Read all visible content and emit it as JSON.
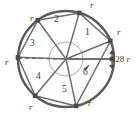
{
  "figure": {
    "type": "geometry-diagram",
    "colors": {
      "stroke": "#5a5a5a",
      "chord": "#6b6b6b",
      "vertex": "#4a4a4a",
      "inner_arc": "#9a9a9a",
      "dashed": "#6b6b6b",
      "text": "#3a3a3a",
      "background": "#ffffff"
    },
    "circle": {
      "center_x": 66,
      "center_y": 59,
      "radius": 48,
      "stroke_width": 2.2
    },
    "inner_arc": {
      "radius": 17,
      "label": "angle-arc"
    },
    "vertices": [
      {
        "id": "v1",
        "angle_deg": 22,
        "x": 110.5,
        "y": 41.0
      },
      {
        "id": "v2",
        "angle_deg": 74,
        "x": 79.2,
        "y": 12.9
      },
      {
        "id": "v3",
        "angle_deg": 126,
        "x": 37.8,
        "y": 20.2
      },
      {
        "id": "v4",
        "angle_deg": 178,
        "x": 18.0,
        "y": 57.3
      },
      {
        "id": "v5",
        "angle_deg": 230,
        "x": 35.1,
        "y": 95.8
      },
      {
        "id": "v6",
        "angle_deg": 282,
        "x": 76.0,
        "y": 105.9
      }
    ],
    "chord_labels": [
      {
        "text": "r",
        "x": 119,
        "y": 33
      },
      {
        "text": "r",
        "x": 92,
        "y": 5
      },
      {
        "text": "r",
        "x": 34,
        "y": 18
      },
      {
        "text": "r",
        "x": 10,
        "y": 61
      },
      {
        "text": "r",
        "x": 32,
        "y": 104
      },
      {
        "text": "r",
        "x": 88,
        "y": 102
      }
    ],
    "angle_labels": [
      {
        "text": "1",
        "x": 88,
        "y": 34
      },
      {
        "text": "2",
        "x": 57,
        "y": 20
      },
      {
        "text": "3",
        "x": 33,
        "y": 45
      },
      {
        "text": "4",
        "x": 38,
        "y": 78
      },
      {
        "text": "5",
        "x": 64,
        "y": 90
      },
      {
        "text": "6",
        "x": 85,
        "y": 74
      }
    ],
    "dimension_label": {
      "text": ".28",
      "unit": "r",
      "x": 113,
      "y": 61
    },
    "dashed_line": {
      "from_x": 18,
      "from_y": 57,
      "to_x": 66,
      "to_y": 59,
      "style": "dashed-reference-radius"
    },
    "arc_marker": {
      "x": 86,
      "y": 67,
      "description": "small filled angle marker near center-right"
    }
  }
}
